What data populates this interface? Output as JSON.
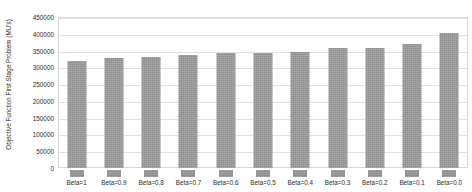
{
  "chart_data": {
    "type": "bar",
    "title": "",
    "xlabel": "",
    "ylabel": "Objective Function First Stage Problem (MU's)",
    "categories": [
      "Beta=1",
      "Beta=0.9",
      "Beta=0.8",
      "Beta=0.7",
      "Beta=0.6",
      "Beta=0.5",
      "Beta=0.4",
      "Beta=0.3",
      "Beta=0.2",
      "Beta=0.1",
      "Beta=0.0"
    ],
    "values": [
      320000,
      327000,
      330000,
      337000,
      342000,
      344000,
      346000,
      357000,
      358000,
      370000,
      403000
    ],
    "ylim": [
      0,
      450000
    ],
    "ytick_values": [
      0,
      50000,
      100000,
      150000,
      200000,
      250000,
      300000,
      350000,
      400000,
      450000
    ],
    "ytick_labels": [
      "0",
      "50000",
      "100000",
      "150000",
      "200000",
      "250000",
      "300000",
      "350000",
      "400000",
      "450000"
    ],
    "grid": true,
    "legend_position": "bottom",
    "bar_color": "#8e8e8e",
    "gridline_color": "#e2e2e2",
    "plot_border_color": "#d9d9d9",
    "background_color": "#ffffff",
    "text_color": "#2b2b2b"
  }
}
